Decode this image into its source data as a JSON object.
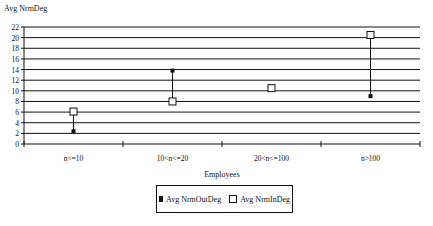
{
  "chart_data": {
    "type": "scatter",
    "title": "",
    "ylabel": "Avg NrmDeg",
    "xlabel": "Employees",
    "categories": [
      "n<=10",
      "10<n<=20",
      "20<n<=100",
      "n>100"
    ],
    "ylim": [
      0,
      22
    ],
    "yticks": [
      0,
      2,
      4,
      6,
      8,
      10,
      12,
      14,
      16,
      18,
      20,
      22
    ],
    "grid": true,
    "legend_position": "bottom",
    "series": [
      {
        "name": "Avg NrmOutDeg",
        "marker": "filled-square",
        "values": [
          2.4,
          13.8,
          10.5,
          9.0
        ]
      },
      {
        "name": "Avg NrmInDeg",
        "marker": "open-square",
        "values": [
          6.1,
          8.0,
          10.5,
          20.5
        ]
      }
    ],
    "connectors": "vertical high-low lines between series per category"
  },
  "labels": {
    "y_axis_title": "Avg NrmDeg",
    "x_axis_title": "Employees",
    "legend_out": "Avg NrmOutDeg",
    "legend_in": "Avg NrmInDeg"
  }
}
